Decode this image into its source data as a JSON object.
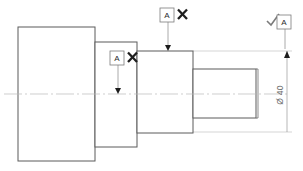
{
  "drawing": {
    "title": "Stepped shaft engineering drawing",
    "view": "side elevation",
    "background_color": "#ffffff",
    "line_color": "#5b5b5b",
    "centerline_color": "#b9b9b9"
  },
  "part": {
    "name": "stepped-shaft",
    "steps": [
      {
        "id": "step-1",
        "label": "largest-diameter-body",
        "x": 18,
        "y": 27,
        "width": 77,
        "height": 134
      },
      {
        "id": "step-2",
        "label": "second-diameter",
        "x": 95,
        "y": 42,
        "width": 42,
        "height": 105
      },
      {
        "id": "step-3",
        "label": "third-diameter",
        "x": 137,
        "y": 51,
        "width": 56,
        "height": 82
      },
      {
        "id": "step-4",
        "label": "smallest-diameter-end",
        "x": 193,
        "y": 69,
        "width": 63,
        "height": 49
      }
    ],
    "end_face_line_x": 258
  },
  "centerline": {
    "y": 94,
    "x_start": 4,
    "x_end": 288
  },
  "annotations": [
    {
      "id": "callout-top",
      "letter": "A",
      "mark": "cross",
      "mark_symbol": "✕",
      "box_x": 160,
      "box_y": 8,
      "leader_x": 168,
      "leader_y_start": 22,
      "leader_y_end": 51
    },
    {
      "id": "callout-middle",
      "letter": "A",
      "mark": "cross",
      "mark_symbol": "✕",
      "box_x": 110,
      "box_y": 51,
      "leader_x": 118,
      "leader_y_start": 65,
      "leader_y_end": 94
    },
    {
      "id": "callout-right",
      "letter": "A",
      "mark": "check",
      "mark_symbol": "✓",
      "box_x": 277,
      "box_y": 15,
      "leader_x": 285,
      "leader_y_start": 29,
      "leader_y_end": 51
    }
  ],
  "dimension": {
    "id": "diameter-dimension",
    "text": "Ø 40",
    "symbol": "Ø",
    "value": "40",
    "orientation": "vertical",
    "line_x": 287,
    "y_top": 51,
    "y_bottom": 132,
    "text_x": 283,
    "text_y": 95,
    "extension_top_y": 51,
    "extension_bottom_y": 132,
    "extension_x_start": 193,
    "extension_x_end": 292
  }
}
